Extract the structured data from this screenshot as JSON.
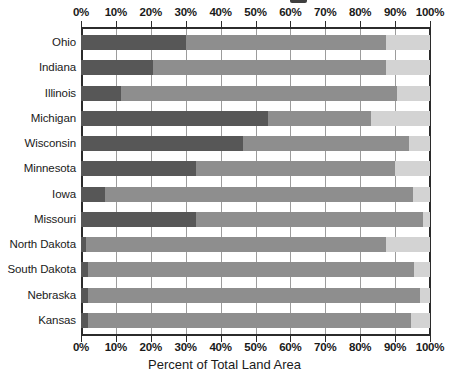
{
  "chart_data": {
    "type": "bar",
    "orientation": "horizontal",
    "stacked": true,
    "normalized_percent": true,
    "title": "",
    "xlabel": "Percent of Total Land Area",
    "ylabel": "",
    "xlim": [
      0,
      100
    ],
    "grid": true,
    "legend_position": "above-cropped",
    "xticks": [
      0,
      10,
      20,
      30,
      40,
      50,
      60,
      70,
      80,
      90,
      100
    ],
    "xtick_labels": [
      "0%",
      "10%",
      "20%",
      "30%",
      "40%",
      "50%",
      "60%",
      "70%",
      "80%",
      "90%",
      "100%"
    ],
    "categories": [
      "Ohio",
      "Indiana",
      "Illinois",
      "Michigan",
      "Wisconsin",
      "Minnesota",
      "Iowa",
      "Missouri",
      "North Dakota",
      "South Dakota",
      "Nebraska",
      "Kansas"
    ],
    "series": [
      {
        "name": "series-dark",
        "color": "#575757",
        "values": [
          30,
          20.5,
          11.5,
          53.5,
          46.5,
          33,
          7,
          33,
          1.5,
          2,
          2,
          2
        ]
      },
      {
        "name": "series-mid",
        "color": "#8e8e8e",
        "values": [
          57.5,
          67,
          79,
          29.5,
          47.5,
          57,
          88,
          65,
          86,
          93.5,
          95,
          92.5
        ]
      },
      {
        "name": "series-light",
        "color": "#d3d3d3",
        "values": [
          12.5,
          12.5,
          9.5,
          17,
          6,
          10,
          5,
          2,
          12.5,
          4.5,
          3,
          5.5
        ]
      }
    ],
    "cumulative_boundaries": [
      [
        30,
        87.5
      ],
      [
        20.5,
        87.5
      ],
      [
        11.5,
        90.5
      ],
      [
        53.5,
        83
      ],
      [
        46.5,
        94
      ],
      [
        33,
        90
      ],
      [
        7,
        95
      ],
      [
        33,
        98
      ],
      [
        1.5,
        87.5
      ],
      [
        2,
        95.5
      ],
      [
        2,
        97
      ],
      [
        2,
        94.5
      ]
    ],
    "colors": {
      "dark": "#575757",
      "mid": "#8e8e8e",
      "light": "#d3d3d3",
      "axis": "#2b2b2b",
      "text": "#1a1a1a",
      "background": "#ffffff"
    }
  }
}
